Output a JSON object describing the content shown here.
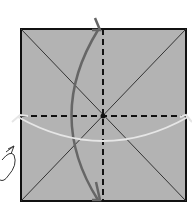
{
  "diagram": {
    "type": "origami-fold-step",
    "paper_color": "#b3b3b3",
    "edge_color": "#111111",
    "crease_color": "#333333",
    "fold_lines": [
      "vertical-valley-fold",
      "horizontal-valley-fold"
    ],
    "arrows": [
      {
        "name": "vertical-fold-arrow",
        "color": "#666666"
      },
      {
        "name": "horizontal-fold-arrow",
        "color": "#e6e6e6"
      },
      {
        "name": "turn-over-arrow",
        "color": "#333333"
      }
    ]
  }
}
